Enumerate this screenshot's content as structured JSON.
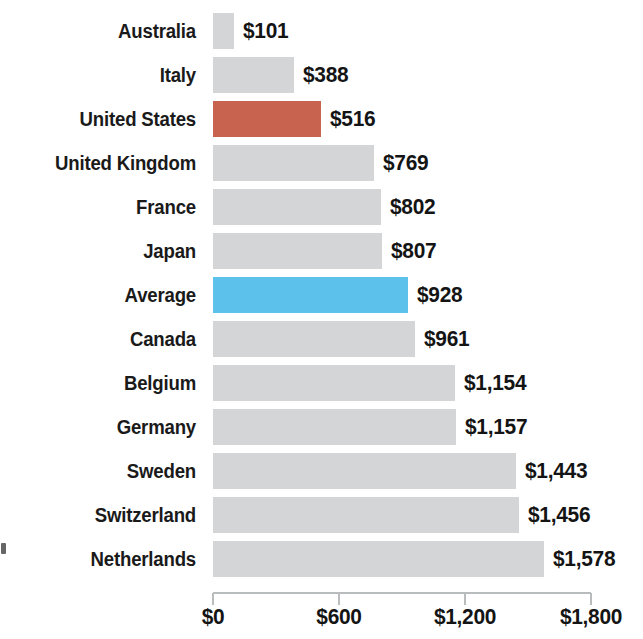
{
  "chart_data": {
    "type": "bar",
    "orientation": "horizontal",
    "title": "",
    "subtitle": "",
    "xlabel": "",
    "ylabel": "",
    "xlim": [
      0,
      1800
    ],
    "grid": false,
    "legend": "none",
    "axis": {
      "tick_values": [
        0,
        600,
        1200,
        1800
      ],
      "tick_labels": [
        "$0",
        "$600",
        "$1,200",
        "$1,800"
      ],
      "position": "bottom"
    },
    "categories": [
      "Australia",
      "Italy",
      "United States",
      "United Kingdom",
      "France",
      "Japan",
      "Average",
      "Canada",
      "Belgium",
      "Germany",
      "Sweden",
      "Switzerland",
      "Netherlands"
    ],
    "values": [
      101,
      388,
      516,
      769,
      802,
      807,
      928,
      961,
      1154,
      1157,
      1443,
      1456,
      1578
    ],
    "value_labels": [
      "$101",
      "$388",
      "$516",
      "$769",
      "$802",
      "$807",
      "$928",
      "$961",
      "$1,154",
      "$1,157",
      "$1,443",
      "$1,456",
      "$1,578"
    ],
    "bar_colors": [
      "#d3d5d6",
      "#d3d5d6",
      "#c7634f",
      "#d3d5d6",
      "#d3d5d6",
      "#d3d5d6",
      "#5cc2ec",
      "#d3d5d6",
      "#d3d5d6",
      "#d3d5d6",
      "#d3d5d6",
      "#d3d5d6",
      "#d3d5d6"
    ],
    "highlighted": {
      "United States": "#c7634f",
      "Average": "#5cc2ec"
    },
    "colors": {
      "default_bar": "#d3d5d6",
      "united_states_bar": "#c7634f",
      "average_bar": "#5cc2ec",
      "text": "#141414",
      "axis_line": "#b9bcbd",
      "background": "#ffffff"
    }
  }
}
